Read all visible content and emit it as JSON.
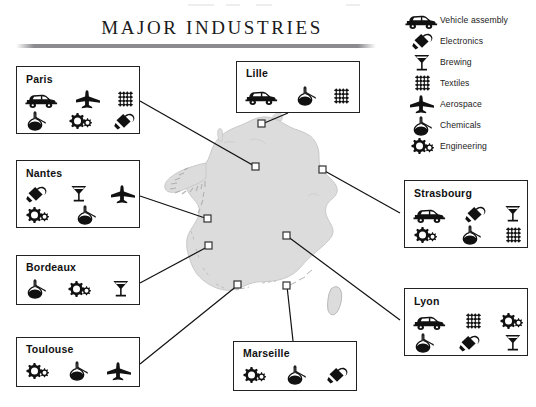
{
  "header": {
    "title": "MAJOR INDUSTRIES"
  },
  "legend": {
    "items": [
      {
        "icon": "vehicle-assembly-icon",
        "label": "Vehicle assembly"
      },
      {
        "icon": "electronics-icon",
        "label": "Electronics"
      },
      {
        "icon": "brewing-icon",
        "label": "Brewing"
      },
      {
        "icon": "textiles-icon",
        "label": "Textiles"
      },
      {
        "icon": "aerospace-icon",
        "label": "Aerospace"
      },
      {
        "icon": "chemicals-icon",
        "label": "Chemicals"
      },
      {
        "icon": "engineering-icon",
        "label": "Engineering"
      }
    ]
  },
  "map": {
    "region": "France",
    "markers": [
      {
        "city": "Lille",
        "x": 262,
        "y": 124
      },
      {
        "city": "Paris",
        "x": 256,
        "y": 167
      },
      {
        "city": "Strasbourg",
        "x": 323,
        "y": 170
      },
      {
        "city": "Nantes",
        "x": 208,
        "y": 219
      },
      {
        "city": "Lyon",
        "x": 287,
        "y": 236
      },
      {
        "city": "Bordeaux",
        "x": 209,
        "y": 246
      },
      {
        "city": "Toulouse",
        "x": 238,
        "y": 285
      },
      {
        "city": "Marseille",
        "x": 287,
        "y": 286
      }
    ]
  },
  "cities": [
    {
      "name": "Paris",
      "industries": [
        "Vehicle assembly",
        "Aerospace",
        "Textiles",
        "Chemicals",
        "Engineering",
        "Electronics"
      ],
      "icons": [
        "vehicle-assembly-icon",
        "aerospace-icon",
        "textiles-icon",
        "chemicals-icon",
        "engineering-icon",
        "electronics-icon"
      ]
    },
    {
      "name": "Nantes",
      "industries": [
        "Electronics",
        "Brewing",
        "Aerospace",
        "Engineering",
        "Chemicals"
      ],
      "icons": [
        "electronics-icon",
        "brewing-icon",
        "aerospace-icon",
        "engineering-icon",
        "chemicals-icon"
      ]
    },
    {
      "name": "Bordeaux",
      "industries": [
        "Chemicals",
        "Engineering",
        "Brewing"
      ],
      "icons": [
        "chemicals-icon",
        "engineering-icon",
        "brewing-icon"
      ]
    },
    {
      "name": "Toulouse",
      "industries": [
        "Engineering",
        "Chemicals",
        "Aerospace"
      ],
      "icons": [
        "engineering-icon",
        "chemicals-icon",
        "aerospace-icon"
      ]
    },
    {
      "name": "Lille",
      "industries": [
        "Vehicle assembly",
        "Chemicals",
        "Textiles"
      ],
      "icons": [
        "vehicle-assembly-icon",
        "chemicals-icon",
        "textiles-icon"
      ]
    },
    {
      "name": "Marseille",
      "industries": [
        "Engineering",
        "Chemicals",
        "Electronics"
      ],
      "icons": [
        "engineering-icon",
        "chemicals-icon",
        "electronics-icon"
      ]
    },
    {
      "name": "Strasbourg",
      "industries": [
        "Vehicle assembly",
        "Electronics",
        "Brewing",
        "Engineering",
        "Chemicals",
        "Textiles"
      ],
      "icons": [
        "vehicle-assembly-icon",
        "electronics-icon",
        "brewing-icon",
        "engineering-icon",
        "chemicals-icon",
        "textiles-icon"
      ]
    },
    {
      "name": "Lyon",
      "industries": [
        "Vehicle assembly",
        "Textiles",
        "Engineering",
        "Chemicals",
        "Electronics",
        "Brewing"
      ],
      "icons": [
        "vehicle-assembly-icon",
        "textiles-icon",
        "engineering-icon",
        "chemicals-icon",
        "electronics-icon",
        "brewing-icon"
      ]
    }
  ],
  "colors": {
    "map_fill": "#dcdcdc",
    "map_stroke": "#bdbdbd",
    "box_border": "#222222",
    "leader_line": "#111111",
    "rule": "#8b8b90",
    "icon": "#111111"
  }
}
